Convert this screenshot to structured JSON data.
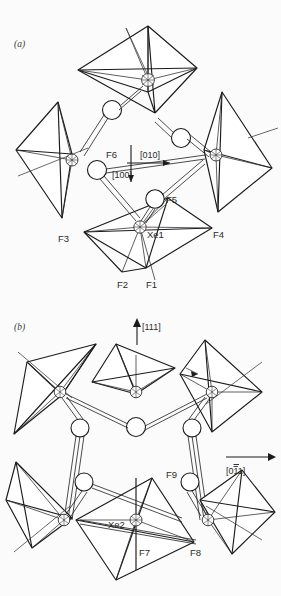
{
  "figure": {
    "background_color": "#fbfbfb",
    "line_color": "#1b1b1b",
    "width": 281,
    "height": 596
  },
  "panels": [
    {
      "id": "a",
      "tag": "(a)",
      "direction_labels": [
        {
          "name": "dir-010",
          "text": "[010]",
          "arrow": "right"
        },
        {
          "name": "dir-100",
          "text": "[100]",
          "arrow": "down"
        }
      ],
      "atom_labels": [
        {
          "name": "label-F6",
          "text": "F6"
        },
        {
          "name": "label-F5",
          "text": "F5"
        },
        {
          "name": "label-F3",
          "text": "F3"
        },
        {
          "name": "label-F4",
          "text": "F4"
        },
        {
          "name": "label-Xe1",
          "text": "Xe1"
        },
        {
          "name": "label-F2",
          "text": "F2"
        },
        {
          "name": "label-F1",
          "text": "F1"
        }
      ]
    },
    {
      "id": "b",
      "tag": "(b)",
      "direction_labels": [
        {
          "name": "dir-111",
          "text": "[111]",
          "arrow": "up"
        },
        {
          "name": "dir-0m11",
          "text_pre": "[0",
          "text_bar": "1",
          "text_post": "1]",
          "arrow": "right"
        }
      ],
      "atom_labels": [
        {
          "name": "label-F9",
          "text": "F9"
        },
        {
          "name": "label-Xe2",
          "text": "Xe2"
        },
        {
          "name": "label-F7",
          "text": "F7"
        },
        {
          "name": "label-F8",
          "text": "F8"
        }
      ]
    }
  ]
}
